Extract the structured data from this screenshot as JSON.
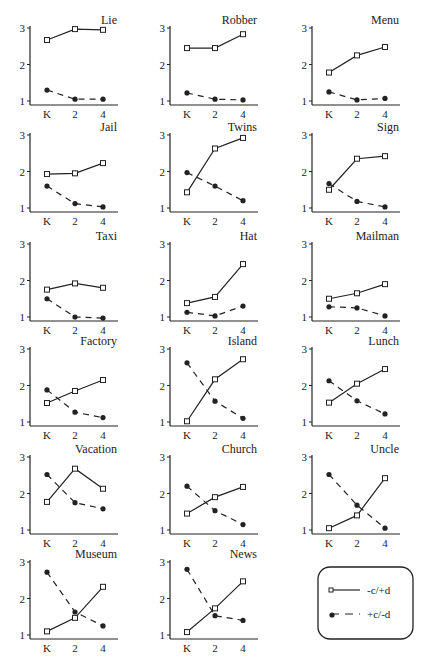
{
  "chart_data": {
    "type": "line",
    "layout": "small-multiples 3x6",
    "x": [
      "K",
      "2",
      "4"
    ],
    "ylim": [
      1,
      3
    ],
    "yticks": [
      1,
      2,
      3
    ],
    "grid": false,
    "legend": {
      "position": "bottom-right",
      "entries": [
        {
          "label": "-c/+d",
          "style": "solid",
          "marker": "open-square"
        },
        {
          "label": "+c/-d",
          "style": "dashed",
          "marker": "filled-circle"
        }
      ]
    },
    "panels": [
      {
        "title": "Lie",
        "series": [
          {
            "name": "-c/+d",
            "values": [
              2.67,
              2.97,
              2.95
            ]
          },
          {
            "name": "+c/-d",
            "values": [
              1.3,
              1.05,
              1.05
            ]
          }
        ]
      },
      {
        "title": "Robber",
        "series": [
          {
            "name": "-c/+d",
            "values": [
              2.45,
              2.45,
              2.83
            ]
          },
          {
            "name": "+c/-d",
            "values": [
              1.22,
              1.05,
              1.03
            ]
          }
        ]
      },
      {
        "title": "Menu",
        "series": [
          {
            "name": "-c/+d",
            "values": [
              1.78,
              2.25,
              2.48
            ]
          },
          {
            "name": "+c/-d",
            "values": [
              1.25,
              1.03,
              1.07
            ]
          }
        ]
      },
      {
        "title": "Jail",
        "series": [
          {
            "name": "-c/+d",
            "values": [
              1.93,
              1.95,
              2.23
            ]
          },
          {
            "name": "+c/-d",
            "values": [
              1.6,
              1.12,
              1.03
            ]
          }
        ]
      },
      {
        "title": "Twins",
        "series": [
          {
            "name": "-c/+d",
            "values": [
              1.43,
              2.63,
              2.92
            ]
          },
          {
            "name": "+c/-d",
            "values": [
              1.97,
              1.6,
              1.2
            ]
          }
        ]
      },
      {
        "title": "Sign",
        "series": [
          {
            "name": "-c/+d",
            "values": [
              1.5,
              2.35,
              2.42
            ]
          },
          {
            "name": "+c/-d",
            "values": [
              1.67,
              1.18,
              1.03
            ]
          }
        ]
      },
      {
        "title": "Taxi",
        "series": [
          {
            "name": "-c/+d",
            "values": [
              1.75,
              1.92,
              1.8
            ]
          },
          {
            "name": "+c/-d",
            "values": [
              1.5,
              1.0,
              0.97
            ]
          }
        ]
      },
      {
        "title": "Hat",
        "series": [
          {
            "name": "-c/+d",
            "values": [
              1.38,
              1.55,
              2.45
            ]
          },
          {
            "name": "+c/-d",
            "values": [
              1.13,
              1.03,
              1.3
            ]
          }
        ]
      },
      {
        "title": "Mailman",
        "series": [
          {
            "name": "-c/+d",
            "values": [
              1.5,
              1.65,
              1.9
            ]
          },
          {
            "name": "+c/-d",
            "values": [
              1.28,
              1.25,
              1.03
            ]
          }
        ]
      },
      {
        "title": "Factory",
        "series": [
          {
            "name": "-c/+d",
            "values": [
              1.52,
              1.85,
              2.15
            ]
          },
          {
            "name": "+c/-d",
            "values": [
              1.88,
              1.27,
              1.12
            ]
          }
        ]
      },
      {
        "title": "Island",
        "series": [
          {
            "name": "-c/+d",
            "values": [
              1.02,
              2.17,
              2.72
            ]
          },
          {
            "name": "+c/-d",
            "values": [
              2.62,
              1.57,
              1.1
            ]
          }
        ]
      },
      {
        "title": "Lunch",
        "series": [
          {
            "name": "-c/+d",
            "values": [
              1.53,
              2.05,
              2.45
            ]
          },
          {
            "name": "+c/-d",
            "values": [
              2.13,
              1.58,
              1.22
            ]
          }
        ]
      },
      {
        "title": "Vacation",
        "series": [
          {
            "name": "-c/+d",
            "values": [
              1.77,
              2.68,
              2.13
            ]
          },
          {
            "name": "+c/-d",
            "values": [
              2.52,
              1.75,
              1.58
            ]
          }
        ]
      },
      {
        "title": "Church",
        "series": [
          {
            "name": "-c/+d",
            "values": [
              1.45,
              1.9,
              2.18
            ]
          },
          {
            "name": "+c/-d",
            "values": [
              2.2,
              1.53,
              1.15
            ]
          }
        ]
      },
      {
        "title": "Uncle",
        "series": [
          {
            "name": "-c/+d",
            "values": [
              1.05,
              1.4,
              2.42
            ]
          },
          {
            "name": "+c/-d",
            "values": [
              2.52,
              1.68,
              1.05
            ]
          }
        ]
      },
      {
        "title": "Museum",
        "series": [
          {
            "name": "-c/+d",
            "values": [
              1.1,
              1.47,
              2.32
            ]
          },
          {
            "name": "+c/-d",
            "values": [
              2.72,
              1.63,
              1.25
            ]
          }
        ]
      },
      {
        "title": "News",
        "series": [
          {
            "name": "-c/+d",
            "values": [
              1.08,
              1.73,
              2.47
            ]
          },
          {
            "name": "+c/-d",
            "values": [
              2.8,
              1.53,
              1.4
            ]
          }
        ]
      }
    ]
  },
  "colors": {
    "line": "#222222",
    "background": "#ffffff"
  }
}
